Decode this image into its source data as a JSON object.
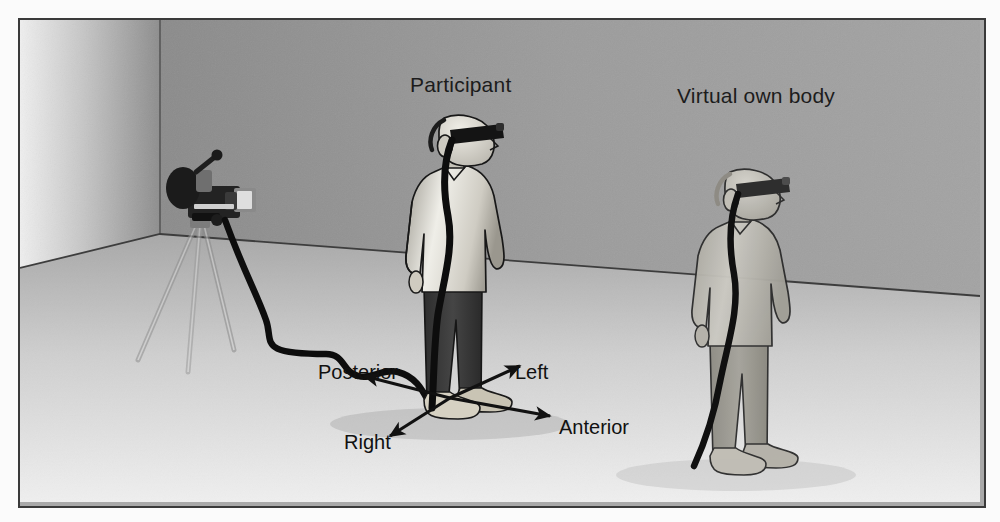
{
  "figure": {
    "kind": "illustration",
    "title_visible": false,
    "border_color": "#3a3a3a",
    "page_background": "#fbfbfb"
  },
  "scene": {
    "description": "Laboratory room corner with a video camera on a tripod filming a participant wearing a head-mounted display and headphones; a washed-out virtual own body stands to the right.",
    "palette": {
      "left_wall_light": "#e8e8e8",
      "left_wall_dark": "#8f8f8f",
      "right_wall": "#9a9a9a",
      "back_wall": "#8a8a8a",
      "floor_near": "#e4e4e4",
      "floor_far": "#b4b4b4",
      "outline": "#1e1e1e",
      "cable": "#111111",
      "skin": "#d7d3c8",
      "shirt_light": "#f2f0ea",
      "shirt_mid": "#b9b6ad",
      "trousers_dark": "#3a3a3a",
      "shoe": "#c9c4b4",
      "virtual_body": "#b0aea6",
      "virtual_trousers": "#9b9890",
      "hmd": "#1b1b1b",
      "camera_body": "#272727"
    }
  },
  "labels": {
    "participant": "Participant",
    "virtual_body": "Virtual own body"
  },
  "directions": [
    {
      "id": "posterior",
      "text": "Posterior",
      "arrow_to": "back-left"
    },
    {
      "id": "left",
      "text": "Left",
      "arrow_to": "upper-right"
    },
    {
      "id": "anterior",
      "text": "Anterior",
      "arrow_to": "right"
    },
    {
      "id": "right",
      "text": "Right",
      "arrow_to": "lower-left"
    }
  ],
  "objects": {
    "camera": "video-camera",
    "tripod": "tripod",
    "cable_participant": "hmd-video-cable",
    "cable_virtual": "hmd-video-cable",
    "hmd": "head-mounted-display",
    "headphones": "headphones"
  }
}
